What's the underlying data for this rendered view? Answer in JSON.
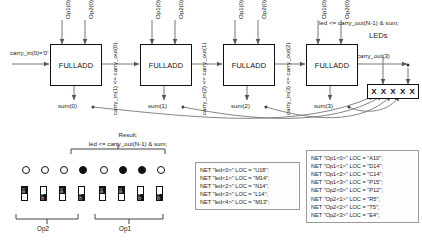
{
  "diagram": {
    "title_note": "Ripple carry adder chain with FPGA pin constraints",
    "adders": [
      {
        "label": "FULLADD",
        "op1": "Op1(0)",
        "op2": "Op2(0)",
        "sum": "sum(0)"
      },
      {
        "label": "FULLADD",
        "op1": "Op1(0)",
        "op2": "Op2(0)",
        "sum": "sum(1)"
      },
      {
        "label": "FULLADD",
        "op1": "Op1(0)",
        "op2": "Op2(0)",
        "sum": "sum(2)"
      },
      {
        "label": "FULLADD",
        "op1": "Op1(0)",
        "op2": "Op2(0)",
        "sum": "sum(3)"
      }
    ],
    "carry_in_first": "carry_in(0)='0'",
    "carries": [
      "carry_in(1) <= carry_out(0)",
      "carry_in(2) <= carry_out(1)",
      "carry_in(3) <= carry_out(2)"
    ],
    "carry_out_last": "carry_out(3)",
    "led_equation_top": "led <= carry_out(N-1) & sum;",
    "leds_label": "LEDs",
    "led_box_cells": [
      "X",
      "X",
      "X",
      "X",
      "X"
    ],
    "result_label": "Result:",
    "result_equation": "led <= carry_out(N-1) & sum;"
  },
  "board": {
    "led_row": [
      {
        "state": "off"
      },
      {
        "state": "off"
      },
      {
        "state": "off"
      },
      {
        "state": "on"
      },
      {
        "state": "off"
      },
      {
        "state": "on"
      },
      {
        "state": "on"
      },
      {
        "state": "off"
      }
    ],
    "switch_row": [
      {
        "position": "ON",
        "on_label": "ON",
        "off_label": "OFF"
      },
      {
        "position": "OFF",
        "on_label": "ON",
        "off_label": "OFF"
      },
      {
        "position": "ON",
        "on_label": "ON",
        "off_label": "OFF"
      },
      {
        "position": "OFF",
        "on_label": "ON",
        "off_label": "OFF"
      },
      {
        "position": "ON",
        "on_label": "ON",
        "off_label": "OFF"
      },
      {
        "position": "ON",
        "on_label": "ON",
        "off_label": "OFF"
      },
      {
        "position": "OFF",
        "on_label": "ON",
        "off_label": "OFF"
      },
      {
        "position": "OFF",
        "on_label": "ON",
        "off_label": "OFF"
      }
    ],
    "group_left_label": "Op2",
    "group_right_label": "Op1"
  },
  "ucf_led": {
    "lines": [
      "NET \"led<0>\" LOC = \"U18\";",
      "NET \"led<1>\" LOC = \"M14\";",
      "NET \"led<2>\" LOC = \"N14\";",
      "NET \"led<3>\" LOC = \"L14\";",
      "NET \"led<4>\" LOC = \"M13\";"
    ]
  },
  "ucf_ops": {
    "lines": [
      "NET \"Op1<0>\" LOC = \"A10\";",
      "NET \"Op1<1>\" LOC = \"D14\";",
      "NET \"Op1<2>\" LOC = \"C14\";",
      "NET \"Op1<3>\" LOC = \"P15\";",
      "NET \"Op2<0>\" LOC = \"P12\";",
      "NET \"Op2<1>\" LOC = \"R5\";",
      "NET \"Op2<2>\" LOC = \"T5\";",
      "NET \"Op2<3>\" LOC = \"E4\";"
    ]
  },
  "colors": {
    "stroke": "#111111",
    "box_border": "#9a9a9a",
    "background": "#ffffff"
  }
}
